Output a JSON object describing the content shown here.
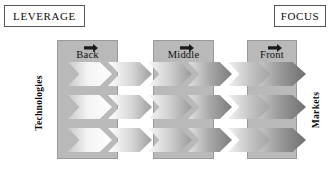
{
  "diagram": {
    "title_left": "LEVERAGE",
    "title_right": "FOCUS",
    "axis_left_label": "Technologies",
    "axis_right_label": "Markets",
    "stages": [
      {
        "id": "back",
        "label": "Back",
        "arrow_icon": "right-arrow-icon"
      },
      {
        "id": "middle",
        "label": "Middle",
        "arrow_icon": "right-arrow-icon"
      },
      {
        "id": "front",
        "label": "Front",
        "arrow_icon": "right-arrow-icon"
      }
    ],
    "rows": [
      {
        "id": "row-1",
        "chevron_count": 6
      },
      {
        "id": "row-2",
        "chevron_count": 6
      },
      {
        "id": "row-3",
        "chevron_count": 6
      }
    ],
    "colors": {
      "stage_fill": "#b9b9b9",
      "stage_border": "#9a9a9a",
      "box_border": "#555555",
      "text": "#0d0d0d",
      "page_background": "#ffffff",
      "chevron_light": "#ffffff",
      "chevron_dark": "#6f6f6f"
    }
  }
}
